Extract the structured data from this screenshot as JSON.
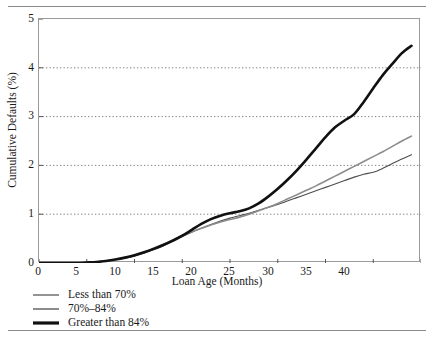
{
  "chart_data": {
    "type": "line",
    "title": "",
    "xlabel": "Loan Age (Months)",
    "ylabel": "Cumulative Defaults (%)",
    "xlim": [
      0,
      40
    ],
    "ylim": [
      0,
      5
    ],
    "xticks": [
      0,
      5,
      10,
      15,
      20,
      25,
      30,
      35,
      40
    ],
    "yticks": [
      0,
      1,
      2,
      3,
      4,
      5
    ],
    "grid": "horizontal-dotted",
    "legend_position": "below-axes-left",
    "series": [
      {
        "name": "Less than 70%",
        "color": "#4d4d4d",
        "width": 1.1,
        "x": [
          0,
          2,
          4,
          5,
          6,
          7,
          8,
          9,
          10,
          11,
          12,
          13,
          14,
          15,
          16,
          17,
          18,
          19,
          20,
          21,
          22,
          23,
          24,
          25,
          26,
          27,
          28,
          29,
          30,
          31,
          32,
          33,
          34,
          35,
          36,
          37,
          38,
          39
        ],
        "y": [
          0,
          0,
          0,
          0.01,
          0.02,
          0.04,
          0.07,
          0.1,
          0.14,
          0.2,
          0.27,
          0.35,
          0.44,
          0.54,
          0.63,
          0.71,
          0.79,
          0.86,
          0.92,
          0.97,
          1.02,
          1.08,
          1.14,
          1.2,
          1.27,
          1.34,
          1.41,
          1.48,
          1.55,
          1.62,
          1.69,
          1.76,
          1.82,
          1.86,
          1.94,
          2.04,
          2.13,
          2.22
        ]
      },
      {
        "name": "70%–84%",
        "color": "#8c8c8c",
        "width": 1.6,
        "x": [
          0,
          2,
          4,
          5,
          6,
          7,
          8,
          9,
          10,
          11,
          12,
          13,
          14,
          15,
          16,
          17,
          18,
          19,
          20,
          21,
          22,
          23,
          24,
          25,
          26,
          27,
          28,
          29,
          30,
          31,
          32,
          33,
          34,
          35,
          36,
          37,
          38,
          39
        ],
        "y": [
          0,
          0,
          0,
          0.01,
          0.02,
          0.04,
          0.07,
          0.11,
          0.16,
          0.22,
          0.3,
          0.38,
          0.47,
          0.56,
          0.64,
          0.71,
          0.78,
          0.84,
          0.89,
          0.94,
          1.0,
          1.07,
          1.14,
          1.22,
          1.31,
          1.4,
          1.49,
          1.58,
          1.68,
          1.78,
          1.88,
          1.98,
          2.08,
          2.18,
          2.28,
          2.39,
          2.5,
          2.6
        ]
      },
      {
        "name": "Greater than 84%",
        "color": "#111111",
        "width": 2.6,
        "x": [
          0,
          2,
          4,
          5,
          6,
          7,
          8,
          9,
          10,
          11,
          12,
          13,
          14,
          15,
          16,
          17,
          18,
          19,
          20,
          21,
          22,
          23,
          24,
          25,
          26,
          27,
          28,
          29,
          30,
          31,
          32,
          33,
          34,
          35,
          36,
          37,
          38,
          39
        ],
        "y": [
          0,
          0,
          0,
          0.01,
          0.02,
          0.04,
          0.07,
          0.11,
          0.16,
          0.22,
          0.29,
          0.37,
          0.46,
          0.56,
          0.68,
          0.8,
          0.9,
          0.97,
          1.02,
          1.06,
          1.12,
          1.22,
          1.36,
          1.52,
          1.7,
          1.9,
          2.12,
          2.35,
          2.58,
          2.78,
          2.92,
          3.05,
          3.3,
          3.58,
          3.85,
          4.08,
          4.3,
          4.45
        ]
      }
    ]
  },
  "axis": {
    "x_tick_labels": [
      "0",
      "5",
      "10",
      "15",
      "20",
      "25",
      "30",
      "35",
      "40"
    ],
    "y_tick_labels": [
      "0",
      "1",
      "2",
      "3",
      "4",
      "5"
    ]
  }
}
